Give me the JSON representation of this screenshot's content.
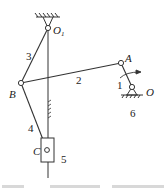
{
  "diagram": {
    "type": "planar linkage mechanism",
    "joints": [
      {
        "id": "O1",
        "label": "O",
        "sub": "1",
        "x": 48,
        "y": 28,
        "grounded": true
      },
      {
        "id": "A",
        "label": "A",
        "x": 121,
        "y": 63
      },
      {
        "id": "B",
        "label": "B",
        "x": 21,
        "y": 83
      },
      {
        "id": "O",
        "label": "O",
        "x": 132,
        "y": 87,
        "grounded": true
      },
      {
        "id": "C",
        "label": "C",
        "x": 47,
        "y": 150
      }
    ],
    "links": [
      {
        "number": "1",
        "from": "O",
        "to": "A"
      },
      {
        "number": "2",
        "from": "A",
        "to": "B"
      },
      {
        "number": "3",
        "from": "O1",
        "to": "B"
      },
      {
        "number": "4",
        "from": "B",
        "to": "C"
      },
      {
        "number": "5",
        "element": "slider"
      },
      {
        "number": "6",
        "element": "frame"
      }
    ],
    "labels": {
      "o1": "O",
      "o1_sub": "1",
      "a": "A",
      "b": "B",
      "o": "O",
      "c": "C",
      "link1": "1",
      "link2": "2",
      "link3": "3",
      "link4": "4",
      "link5": "5",
      "link6": "6"
    },
    "rotation_arrow": "crank rotation arrow",
    "line_color": "#333333"
  }
}
